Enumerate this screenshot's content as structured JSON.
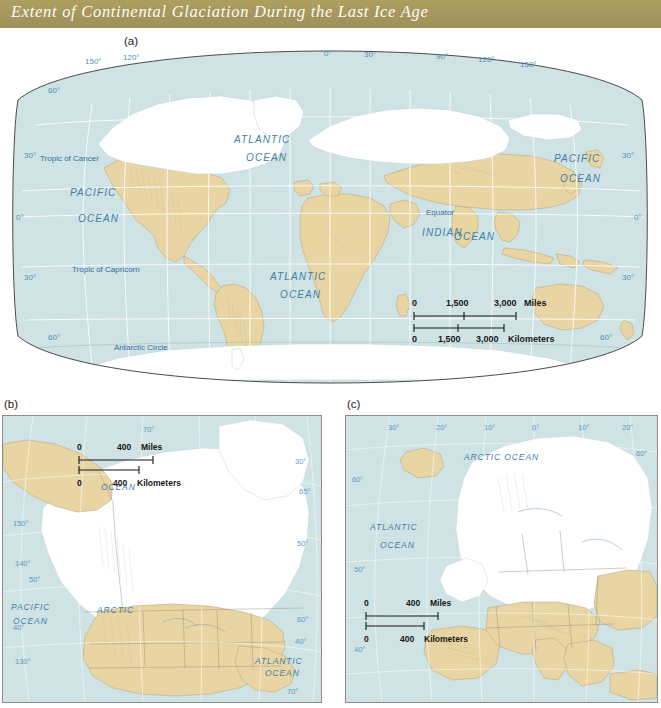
{
  "figure": {
    "title": "Extent of Continental Glaciation During the Last Ice Age",
    "title_bar_color": "#a89a62",
    "ocean_color": "#cfe2e4",
    "land_color": "#e8d5a3",
    "ice_color": "#ffffff"
  },
  "panels": {
    "a": {
      "label": "(a)",
      "kind": "world-map",
      "projection": "oval / Robinson-like world projection",
      "longitude_labels": [
        "150°",
        "120°",
        "0°",
        "30°",
        "90°",
        "120°",
        "150°"
      ],
      "latitude_labels_left": [
        "60°",
        "30°",
        "0°",
        "30°",
        "60°"
      ],
      "latitude_labels_right": [
        "30°",
        "0°",
        "30°",
        "60°"
      ],
      "reference_lines": [
        "Tropic of Cancer",
        "Equator",
        "Tropic of Capricorn",
        "Antarctic Circle"
      ],
      "ocean_labels": [
        "ATLANTIC",
        "OCEAN",
        "PACIFIC",
        "OCEAN",
        "PACIFIC",
        "OCEAN",
        "ATLANTIC",
        "OCEAN",
        "INDIAN",
        "OCEAN"
      ],
      "scale": {
        "miles": {
          "ticks": [
            "0",
            "1,500",
            "3,000"
          ],
          "unit": "Miles"
        },
        "kilometers": {
          "ticks": [
            "0",
            "1,500",
            "3,000"
          ],
          "unit": "Kilometers"
        }
      }
    },
    "b": {
      "label": "(b)",
      "kind": "north-america-inset",
      "ocean_labels": [
        "ARCTIC",
        "OCEAN",
        "PACIFIC",
        "OCEAN",
        "ATLANTIC",
        "OCEAN"
      ],
      "graticule_labels_left": [
        "150°",
        "140°",
        "50°",
        "40°",
        "130°"
      ],
      "graticule_labels_right": [
        "70°",
        "30°",
        "65°",
        "50°",
        "60°",
        "40°",
        "70°"
      ],
      "scale": {
        "miles": {
          "ticks": [
            "0",
            "400"
          ],
          "unit": "Miles"
        },
        "kilometers": {
          "ticks": [
            "0",
            "400"
          ],
          "unit": "Kilometers"
        }
      }
    },
    "c": {
      "label": "(c)",
      "kind": "europe-inset",
      "ocean_labels": [
        "ARCTIC OCEAN",
        "ATLANTIC",
        "OCEAN"
      ],
      "longitude_labels": [
        "30°",
        "20°",
        "10°",
        "0°",
        "10°",
        "20°",
        "60°"
      ],
      "latitude_labels": [
        "60°",
        "50°",
        "40°"
      ],
      "scale": {
        "miles": {
          "ticks": [
            "0",
            "400"
          ],
          "unit": "Miles"
        },
        "kilometers": {
          "ticks": [
            "0",
            "400"
          ],
          "unit": "Kilometers"
        }
      }
    }
  }
}
